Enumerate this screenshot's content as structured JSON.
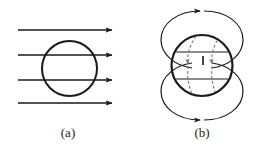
{
  "figure": {
    "width": 264,
    "height": 155,
    "background_color": "#ffffff",
    "stroke_color": "#1a1a1a",
    "dashed_stroke_color": "#6b6b6b",
    "caption_color": "#1a1a1a"
  },
  "panels": [
    {
      "id": "a",
      "label": "(a)",
      "label_x": 68,
      "label_y": 133,
      "description": "uniform-field-through-sphere",
      "circle": {
        "cx": 69.5,
        "cy": 68.5,
        "r": 27.5,
        "stroke_width": 2.0
      },
      "field_lines": {
        "count": 4,
        "direction": "right",
        "x_start": 18,
        "x_end": 115,
        "stroke_width": 1.4,
        "y_values": [
          30,
          55,
          80,
          103
        ],
        "arrowhead_length": 7,
        "arrowhead_width": 5
      }
    },
    {
      "id": "b",
      "label": "(b)",
      "label_x": 202,
      "label_y": 133,
      "description": "dipole-loops-around-sphere-with-internal-current",
      "circle": {
        "cx": 202,
        "cy": 65.5,
        "r": 30.5,
        "stroke_width": 2.2
      },
      "loops": [
        {
          "name": "upper-loop",
          "cx": 202,
          "cy": 40,
          "rx": 41,
          "ry": 29,
          "arrow_direction": "left",
          "arrow_x": 204,
          "arrow_y": 11,
          "stroke_width": 1.2
        },
        {
          "name": "lower-loop",
          "cx": 202,
          "cy": 91,
          "rx": 41,
          "ry": 29,
          "arrow_direction": "left",
          "arrow_x": 204,
          "arrow_y": 120,
          "stroke_width": 1.2
        }
      ],
      "internal_lines": {
        "count": 2,
        "stroke_width": 1.2,
        "segments": [
          {
            "y": 52,
            "x1": 176,
            "x2": 229
          },
          {
            "y": 79,
            "x1": 176,
            "x2": 229
          }
        ]
      },
      "internal_dashed_arrows": {
        "count": 2,
        "direction": "down",
        "dash_pattern": "3 2",
        "stroke_width": 1.1,
        "curves": [
          {
            "name": "left-dashed-arrow",
            "x_top": 195,
            "y_top": 38,
            "x_bottom": 189,
            "y_bottom": 92,
            "bulge": -7
          },
          {
            "name": "right-dashed-arrow",
            "x_top": 219,
            "y_top": 38,
            "x_bottom": 213,
            "y_bottom": 92,
            "bulge": -7
          }
        ],
        "arrowhead_y": 64
      },
      "center_mark": {
        "x": 203,
        "y": 60,
        "height": 9,
        "width": 1.6
      }
    }
  ]
}
